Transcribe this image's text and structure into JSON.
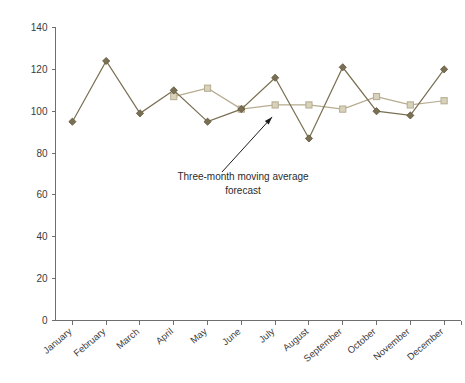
{
  "chart_data": {
    "type": "line",
    "title": "",
    "xlabel": "",
    "ylabel": "",
    "ylim": [
      0,
      140
    ],
    "yticks": [
      0,
      20,
      40,
      60,
      80,
      100,
      120,
      140
    ],
    "grid": false,
    "legend": "none",
    "categories": [
      "January",
      "February",
      "March",
      "April",
      "May",
      "June",
      "July",
      "August",
      "September",
      "October",
      "November",
      "December"
    ],
    "series": [
      {
        "name": "Actual",
        "marker": "diamond",
        "color": "#7a6f52",
        "values": [
          95,
          124,
          99,
          110,
          95,
          101,
          116,
          87,
          121,
          100,
          98,
          120
        ]
      },
      {
        "name": "Three-month moving average forecast",
        "marker": "square",
        "color": "#b5ab8e",
        "values": [
          null,
          null,
          null,
          107,
          111,
          101,
          103,
          103,
          101,
          107,
          103,
          105
        ]
      }
    ],
    "annotations": [
      {
        "name": "forecast-annotation",
        "line1": "Three-month moving average",
        "line2": "forecast",
        "points_to": "July forecast point"
      }
    ]
  },
  "colors": {
    "actual_series": "#7a6f52",
    "forecast_series": "#b5ab8e",
    "axis": "#6e6e6e",
    "text": "#2b2b2b",
    "background": "#ffffff"
  }
}
